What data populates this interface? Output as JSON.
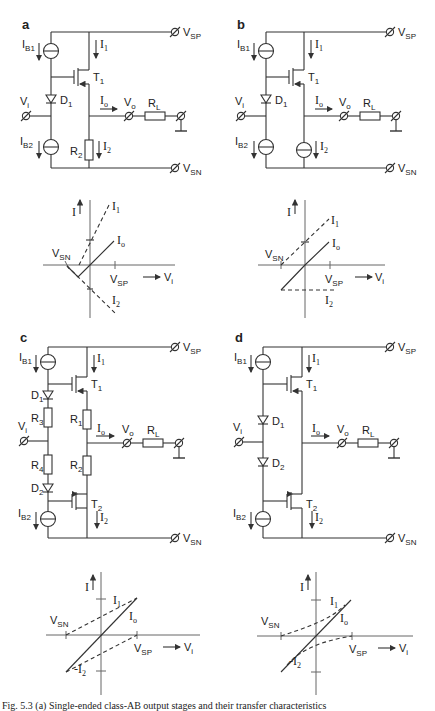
{
  "figure": {
    "caption": "Fig. 5.3 (a) Single-ended class-AB output stages and their transfer characteristics"
  },
  "panels": [
    {
      "id": "a",
      "label": "a",
      "circuit": {
        "supply_pos": "V",
        "supply_pos_sub": "SP",
        "supply_neg": "V",
        "supply_neg_sub": "SN",
        "bias_top": "I",
        "bias_top_sub": "B1",
        "bias_bottom": "I",
        "bias_bottom_sub": "B2",
        "current_top": "I",
        "current_top_sub": "1",
        "current_bottom": "I",
        "current_bottom_sub": "2",
        "transistor_top": "T",
        "transistor_top_sub": "1",
        "diode_top": "D",
        "diode_top_sub": "1",
        "input": "V",
        "input_sub": "i",
        "output_current": "I",
        "output_current_sub": "o",
        "output": "V",
        "output_sub": "o",
        "load": "R",
        "load_sub": "L",
        "pulldown": "R",
        "pulldown_sub": "2"
      },
      "plot": {
        "y_axis": "I",
        "x_axis": "V",
        "x_axis_sub": "i",
        "vsn": "V",
        "vsn_sub": "SN",
        "vsp": "V",
        "vsp_sub": "SP",
        "i1": "I",
        "i1_sub": "1",
        "io": "I",
        "io_sub": "o",
        "i2": "I",
        "i2_sub": "2"
      }
    },
    {
      "id": "b",
      "label": "b",
      "circuit": {
        "supply_pos": "V",
        "supply_pos_sub": "SP",
        "supply_neg": "V",
        "supply_neg_sub": "SN",
        "bias_top": "I",
        "bias_top_sub": "B1",
        "bias_bottom": "I",
        "bias_bottom_sub": "B2",
        "current_top": "I",
        "current_top_sub": "1",
        "current_bottom": "I",
        "current_bottom_sub": "2",
        "transistor_top": "T",
        "transistor_top_sub": "1",
        "diode_top": "D",
        "diode_top_sub": "1",
        "input": "V",
        "input_sub": "i",
        "output_current": "I",
        "output_current_sub": "o",
        "output": "V",
        "output_sub": "o",
        "load": "R",
        "load_sub": "L"
      },
      "plot": {
        "y_axis": "I",
        "x_axis": "V",
        "x_axis_sub": "i",
        "vsn": "V",
        "vsn_sub": "SN",
        "vsp": "V",
        "vsp_sub": "SP",
        "i1": "I",
        "i1_sub": "1",
        "io": "I",
        "io_sub": "o",
        "i2": "I",
        "i2_sub": "2"
      }
    },
    {
      "id": "c",
      "label": "c",
      "circuit": {
        "supply_pos": "V",
        "supply_pos_sub": "SP",
        "supply_neg": "V",
        "supply_neg_sub": "SN",
        "bias_top": "I",
        "bias_top_sub": "B1",
        "bias_bottom": "I",
        "bias_bottom_sub": "B2",
        "current_top": "I",
        "current_top_sub": "1",
        "current_bottom": "I",
        "current_bottom_sub": "2",
        "transistor_top": "T",
        "transistor_top_sub": "1",
        "transistor_bottom": "T",
        "transistor_bottom_sub": "2",
        "diode_top": "D",
        "diode_top_sub": "1",
        "diode_bottom": "D",
        "diode_bottom_sub": "2",
        "r1": "R",
        "r1_sub": "1",
        "r2": "R",
        "r2_sub": "2",
        "r3": "R",
        "r3_sub": "3",
        "r4": "R",
        "r4_sub": "4",
        "input": "V",
        "input_sub": "i",
        "output_current": "I",
        "output_current_sub": "o",
        "output": "V",
        "output_sub": "o",
        "load": "R",
        "load_sub": "L"
      },
      "plot": {
        "y_axis": "I",
        "x_axis": "V",
        "x_axis_sub": "i",
        "vsn": "V",
        "vsn_sub": "SN",
        "vsp": "V",
        "vsp_sub": "SP",
        "i1": "I",
        "i1_sub": "1",
        "io": "I",
        "io_sub": "o",
        "i2": "-I",
        "i2_sub": "2"
      }
    },
    {
      "id": "d",
      "label": "d",
      "circuit": {
        "supply_pos": "V",
        "supply_pos_sub": "SP",
        "supply_neg": "V",
        "supply_neg_sub": "SN",
        "bias_top": "I",
        "bias_top_sub": "B1",
        "bias_bottom": "I",
        "bias_bottom_sub": "B2",
        "current_top": "I",
        "current_top_sub": "1",
        "current_bottom": "I",
        "current_bottom_sub": "2",
        "transistor_top": "T",
        "transistor_top_sub": "1",
        "transistor_bottom": "T",
        "transistor_bottom_sub": "2",
        "diode_top": "D",
        "diode_top_sub": "1",
        "diode_bottom": "D",
        "diode_bottom_sub": "2",
        "input": "V",
        "input_sub": "i",
        "output_current": "I",
        "output_current_sub": "o",
        "output": "V",
        "output_sub": "o",
        "load": "R",
        "load_sub": "L"
      },
      "plot": {
        "y_axis": "I",
        "x_axis": "V",
        "x_axis_sub": "i",
        "vsn": "V",
        "vsn_sub": "SN",
        "vsp": "V",
        "vsp_sub": "SP",
        "i1": "I",
        "i1_sub": "1",
        "io": "I",
        "io_sub": "o",
        "i2": "-I",
        "i2_sub": "2"
      }
    }
  ]
}
